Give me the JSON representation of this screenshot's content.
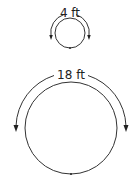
{
  "diagram": {
    "small_circle": {
      "label": "4 ft",
      "cx": 70,
      "cy": 33,
      "r": 15,
      "arc_r": 19
    },
    "large_circle": {
      "label": "18 ft",
      "cx": 71,
      "cy": 128,
      "r": 46,
      "arc_r": 55
    },
    "colors": {
      "stroke": "#333333",
      "text": "#222222",
      "background": "#ffffff"
    }
  }
}
